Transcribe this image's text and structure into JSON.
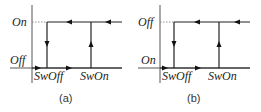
{
  "panels": [
    {
      "id": "a",
      "caption": "(a)",
      "y_top_label": "On",
      "y_bottom_label": "Off",
      "x_left_label": "SwOff",
      "x_right_label": "SwOn"
    },
    {
      "id": "b",
      "caption": "(b)",
      "y_top_label": "Off",
      "y_bottom_label": "On",
      "x_left_label": "SwOff",
      "x_right_label": "SwOn"
    }
  ]
}
